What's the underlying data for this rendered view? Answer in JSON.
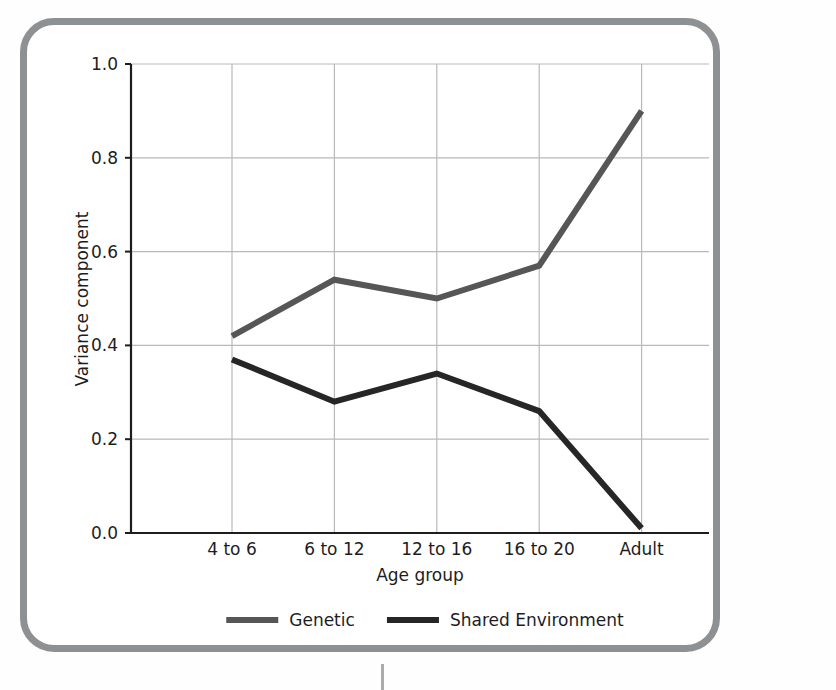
{
  "figure": {
    "border_color": "#8e9193",
    "background": "#ffffff"
  },
  "chart_data": {
    "type": "line",
    "title": "",
    "xlabel": "Age group",
    "ylabel": "Variance component",
    "categories": [
      "4 to 6",
      "6 to 12",
      "12 to 16",
      "16 to 20",
      "Adult"
    ],
    "series": [
      {
        "name": "Genetic",
        "color": "#565656",
        "values": [
          0.42,
          0.54,
          0.5,
          0.57,
          0.9
        ]
      },
      {
        "name": "Shared Environment",
        "color": "#262626",
        "values": [
          0.37,
          0.28,
          0.34,
          0.26,
          0.01
        ]
      }
    ],
    "ylim": [
      0.0,
      1.0
    ],
    "yticks": [
      "0.0",
      "0.2",
      "0.4",
      "0.6",
      "0.8",
      "1.0"
    ],
    "ytick_values": [
      0.0,
      0.2,
      0.4,
      0.6,
      0.8,
      1.0
    ],
    "grid": true,
    "grid_color": "#b9b9b9",
    "legend_position": "below-axis",
    "legend": [
      "Genetic",
      "Shared Environment"
    ]
  },
  "axes": {
    "y_label": "Variance component",
    "x_label": "Age group"
  },
  "legend": {
    "entries": [
      {
        "label": "Genetic",
        "color": "#565656"
      },
      {
        "label": "Shared Environment",
        "color": "#262626"
      }
    ]
  }
}
